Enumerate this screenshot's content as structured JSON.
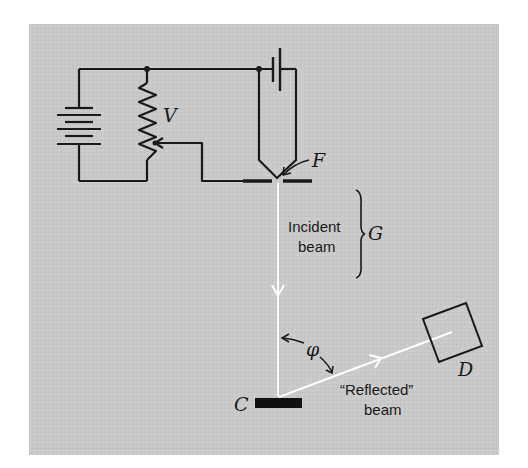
{
  "diagram": {
    "colors": {
      "panel": "#c8c8c8",
      "background": "#ffffff",
      "wire": "#1a1a1a",
      "beam": "#ffffff"
    },
    "labels": {
      "voltage": "V",
      "filament": "F",
      "gun": "G",
      "crystal": "C",
      "detector": "D",
      "angle": "φ",
      "incident_line1": "Incident",
      "incident_line2": "beam",
      "reflected_line1": "“Reflected”",
      "reflected_line2": "beam"
    },
    "components": [
      {
        "id": "battery",
        "name": "Battery"
      },
      {
        "id": "rheostat",
        "name": "Variable resistor (potentiometer)",
        "label": "V"
      },
      {
        "id": "filament-cell",
        "name": "Filament heater cell"
      },
      {
        "id": "filament",
        "name": "Filament",
        "label": "F"
      },
      {
        "id": "electron-gun",
        "name": "Electron gun",
        "label": "G"
      },
      {
        "id": "crystal",
        "name": "Crystal target",
        "label": "C"
      },
      {
        "id": "detector",
        "name": "Detector",
        "label": "D"
      }
    ]
  }
}
